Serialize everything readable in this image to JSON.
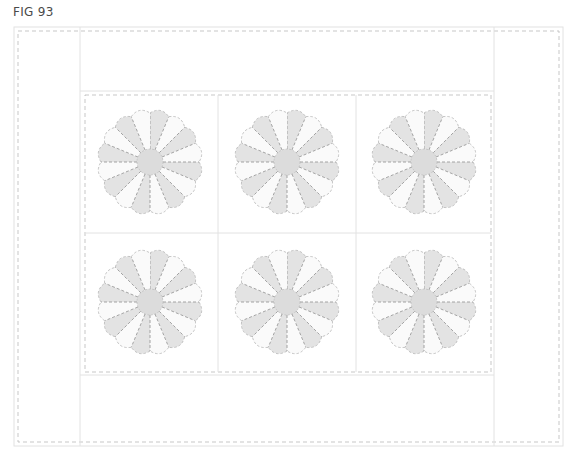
{
  "figure": {
    "label": "FIG 93"
  },
  "quilt": {
    "layout": {
      "outer": {
        "x": 14,
        "y": 27,
        "w": 549,
        "h": 419
      },
      "outer_dashed": {
        "x": 18,
        "y": 31,
        "w": 541,
        "h": 411
      },
      "center_panel": {
        "x": 80,
        "y": 91,
        "w": 414,
        "h": 284
      },
      "inner_dashed": {
        "x": 85,
        "y": 95,
        "w": 406,
        "h": 277
      },
      "grid_cols_x": [
        218,
        356
      ],
      "grid_row_y": 233
    },
    "blocks": {
      "rows": 2,
      "cols": 3,
      "pattern": "Dresden Plate",
      "petal_count": 16,
      "centers": [
        {
          "x": 150,
          "y": 162
        },
        {
          "x": 287,
          "y": 162
        },
        {
          "x": 424,
          "y": 162
        },
        {
          "x": 150,
          "y": 302
        },
        {
          "x": 287,
          "y": 302
        },
        {
          "x": 424,
          "y": 302
        }
      ],
      "outer_radius": 54,
      "center_radius": 13
    },
    "colors": {
      "background": "#ffffff",
      "petal_shaded": "#e3e3e3",
      "petal_light": "#fafafa",
      "center_circle": "#dcdcdc",
      "seam_dash": "#9a9a9a",
      "frame_line": "#e2e2e2",
      "label_text": "#4a4a4a"
    }
  }
}
